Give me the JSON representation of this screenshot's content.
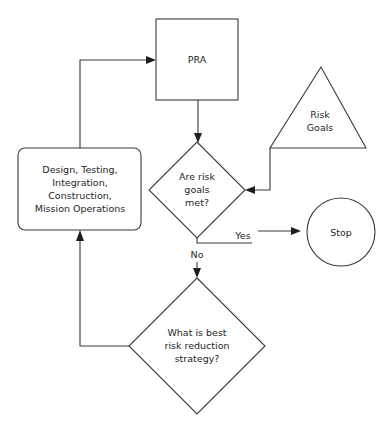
{
  "diagram": {
    "colors": {
      "line": "#3a3a3a",
      "text": "#1e1e1e",
      "background": "#ffffff"
    },
    "nodes": {
      "pra": {
        "shape": "rectangle",
        "label": "PRA"
      },
      "risk_goals": {
        "shape": "triangle",
        "lines": [
          "Risk",
          "Goals"
        ]
      },
      "decision_goals_met": {
        "shape": "diamond",
        "lines": [
          "Are risk",
          "goals",
          "met?"
        ]
      },
      "stop": {
        "shape": "circle",
        "label": "Stop"
      },
      "decision_strategy": {
        "shape": "diamond",
        "lines": [
          "What is best",
          "risk reduction",
          "strategy?"
        ]
      },
      "design_box": {
        "shape": "rounded-rectangle",
        "lines": [
          "Design, Testing,",
          "Integration,",
          "Construction,",
          "Mission Operations"
        ]
      }
    },
    "edges": [
      {
        "from": "pra",
        "to": "decision_goals_met",
        "label": ""
      },
      {
        "from": "risk_goals",
        "to": "decision_goals_met",
        "label": ""
      },
      {
        "from": "decision_goals_met",
        "to": "stop",
        "label": "Yes"
      },
      {
        "from": "decision_goals_met",
        "to": "decision_strategy",
        "label": "No"
      },
      {
        "from": "decision_strategy",
        "to": "design_box",
        "label": ""
      },
      {
        "from": "design_box",
        "to": "pra",
        "label": ""
      }
    ],
    "edge_labels": {
      "yes": "Yes",
      "no": "No"
    }
  }
}
